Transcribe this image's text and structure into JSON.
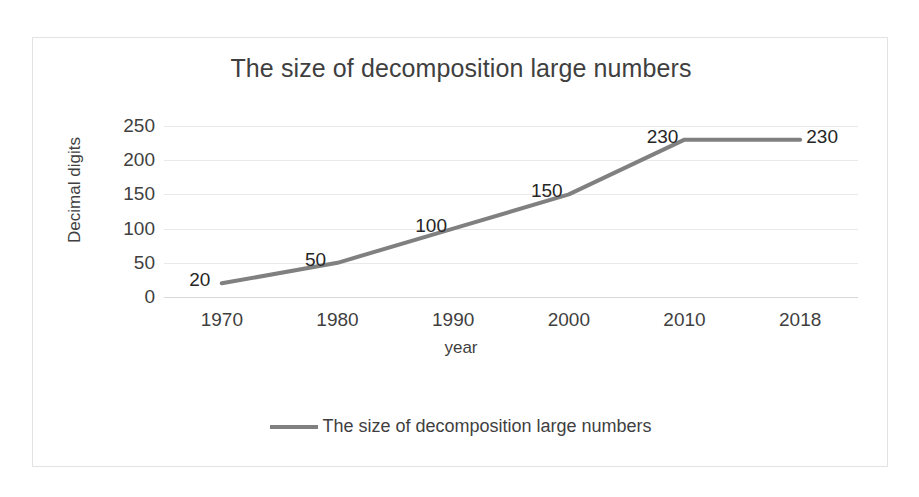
{
  "chart_data": {
    "type": "line",
    "title": "The size of decomposition large numbers",
    "xlabel": "year",
    "ylabel": "Decimal digits",
    "categories": [
      "1970",
      "1980",
      "1990",
      "2000",
      "2010",
      "2018"
    ],
    "values": [
      20,
      50,
      100,
      150,
      230,
      230
    ],
    "data_labels": [
      "20",
      "50",
      "100",
      "150",
      "230",
      "230"
    ],
    "yticks": [
      "250",
      "200",
      "150",
      "100",
      "50",
      "0"
    ],
    "ylim": [
      0,
      250
    ],
    "ytick_values": [
      250,
      200,
      150,
      100,
      50,
      0
    ],
    "grid": "horizontal",
    "legend_position": "bottom",
    "series": [
      {
        "name": "The size of decomposition large numbers",
        "values": [
          20,
          50,
          100,
          150,
          230,
          230
        ],
        "color": "#808080"
      }
    ]
  },
  "legend": {
    "entries": [
      {
        "label": "The size of decomposition large numbers",
        "color": "#808080"
      }
    ]
  },
  "colors": {
    "series": "#808080",
    "gridline": "#e9e9e9",
    "border": "#e3e3e3",
    "text": "#3f3f3f",
    "background": "#ffffff"
  }
}
